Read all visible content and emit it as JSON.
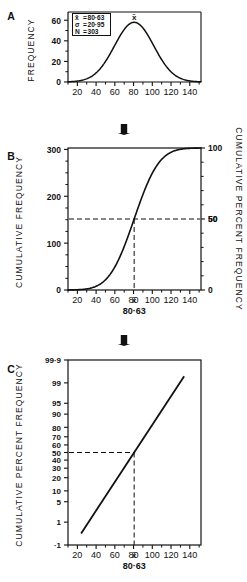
{
  "figure": {
    "caption_absent": true,
    "arrow_icon": "down-arrow-icon",
    "panels": [
      {
        "letter": "A",
        "type": "frequency-distribution",
        "ylabel": "FREQUENCY",
        "yticks": [
          "0",
          "20",
          "40",
          "60"
        ],
        "xticks": [
          "20",
          "40",
          "60",
          "80",
          "100",
          "120",
          "140"
        ],
        "mean_marker": "x̄",
        "stats": [
          {
            "symbol": "x̄",
            "eq": "=",
            "value": "80·63"
          },
          {
            "symbol": "σ",
            "eq": "=",
            "value": "20·95"
          },
          {
            "symbol": "N",
            "eq": "=",
            "value": "303"
          }
        ]
      },
      {
        "letter": "B",
        "type": "cumulative-ogive",
        "ylabel_left": "CUMULATIVE FREQUENCY",
        "ylabel_right": "CUMULATIVE PERCENT FREQUENCY",
        "yticks_left": [
          "0",
          "100",
          "200",
          "300"
        ],
        "yticks_right": [
          "0",
          "50",
          "100"
        ],
        "xticks": [
          "20",
          "40",
          "60",
          "80",
          "100",
          "120",
          "140"
        ],
        "mean_marker": "x̄",
        "mean_label": "80·63",
        "guide_value": "50"
      },
      {
        "letter": "C",
        "type": "probability-plot",
        "ylabel": "CUMULATIVE PERCENT FREQUENCY",
        "yticks": [
          "·1",
          "1",
          "5",
          "10",
          "20",
          "30",
          "40",
          "50",
          "60",
          "70",
          "80",
          "90",
          "95",
          "99",
          "99·9"
        ],
        "xticks": [
          "20",
          "40",
          "60",
          "80",
          "100",
          "120",
          "140"
        ],
        "mean_marker": "x̄",
        "mean_label": "80·63",
        "guide_value": "50"
      }
    ],
    "colors": {
      "ink": "#111111",
      "paper": "#ffffff",
      "guide": "#222222"
    }
  },
  "chart_data": [
    {
      "type": "line",
      "panel": "A",
      "title": "",
      "xlabel": "",
      "ylabel": "FREQUENCY",
      "xlim": [
        10,
        150
      ],
      "ylim": [
        0,
        68
      ],
      "xticks": [
        20,
        40,
        60,
        80,
        100,
        120,
        140
      ],
      "yticks": [
        0,
        20,
        40,
        60
      ],
      "grid": false,
      "distribution": {
        "mean": 80.63,
        "sigma": 20.95,
        "n": 303,
        "peak_frequency": 58
      },
      "x": [
        14,
        20,
        26,
        32,
        38,
        44,
        50,
        56,
        62,
        68,
        74,
        80.63,
        86,
        92,
        98,
        104,
        110,
        116,
        122,
        128,
        134,
        140,
        146
      ],
      "values": [
        0.4,
        1.1,
        2.4,
        4.7,
        8.4,
        13.8,
        21.0,
        29.8,
        39.2,
        48.0,
        54.6,
        58.0,
        56.8,
        51.6,
        43.8,
        34.6,
        25.4,
        17.4,
        11.2,
        6.7,
        3.8,
        2.0,
        1.0
      ]
    },
    {
      "type": "line",
      "panel": "B",
      "title": "",
      "xlabel": "",
      "ylabel": "CUMULATIVE FREQUENCY",
      "ylabel2": "CUMULATIVE PERCENT FREQUENCY",
      "xlim": [
        10,
        150
      ],
      "ylim": [
        0,
        303
      ],
      "ylim2": [
        0,
        100
      ],
      "xticks": [
        20,
        40,
        60,
        80,
        100,
        120,
        140
      ],
      "yticks": [
        0,
        100,
        200,
        300
      ],
      "yticks2": [
        0,
        50,
        100
      ],
      "grid": false,
      "x": [
        14,
        20,
        26,
        32,
        38,
        44,
        50,
        56,
        62,
        68,
        74,
        80.63,
        86,
        92,
        98,
        104,
        110,
        116,
        122,
        128,
        134,
        140,
        146
      ],
      "values": [
        0.6,
        1.8,
        4.5,
        9.6,
        18.6,
        32.7,
        53.4,
        81.3,
        116.1,
        156.4,
        199.6,
        151.5,
        271.0,
        284.5,
        292.9,
        297.6,
        300.2,
        301.5,
        302.2,
        302.6,
        302.8,
        302.9,
        303.0
      ],
      "values_percent": [
        0.2,
        0.6,
        1.5,
        3.2,
        6.1,
        10.8,
        17.6,
        26.8,
        38.3,
        51.6,
        65.9,
        50.0,
        89.4,
        93.9,
        96.7,
        98.2,
        99.1,
        99.5,
        99.7,
        99.9,
        99.9,
        100.0,
        100.0
      ],
      "annotations": [
        {
          "label": "50",
          "type": "horizontal-guide",
          "y_percent": 50
        },
        {
          "label": "x̄ = 80·63",
          "type": "vertical-guide",
          "x": 80.63
        }
      ]
    },
    {
      "type": "line",
      "panel": "C",
      "title": "",
      "xlabel": "",
      "ylabel": "CUMULATIVE PERCENT FREQUENCY",
      "scale": "probit",
      "xlim": [
        10,
        150
      ],
      "xticks": [
        20,
        40,
        60,
        80,
        100,
        120,
        140
      ],
      "yticks_percent": [
        0.1,
        1,
        5,
        10,
        20,
        30,
        40,
        50,
        60,
        70,
        80,
        90,
        95,
        99,
        99.9
      ],
      "grid": false,
      "x": [
        24,
        40,
        60,
        80.63,
        100,
        120,
        134
      ],
      "values_percent": [
        0.4,
        2.7,
        17.2,
        50.0,
        82.3,
        96.8,
        99.5
      ],
      "annotations": [
        {
          "label": "50",
          "type": "horizontal-guide",
          "y_percent": 50
        },
        {
          "label": "x̄ = 80·63",
          "type": "vertical-guide",
          "x": 80.63
        }
      ]
    }
  ]
}
